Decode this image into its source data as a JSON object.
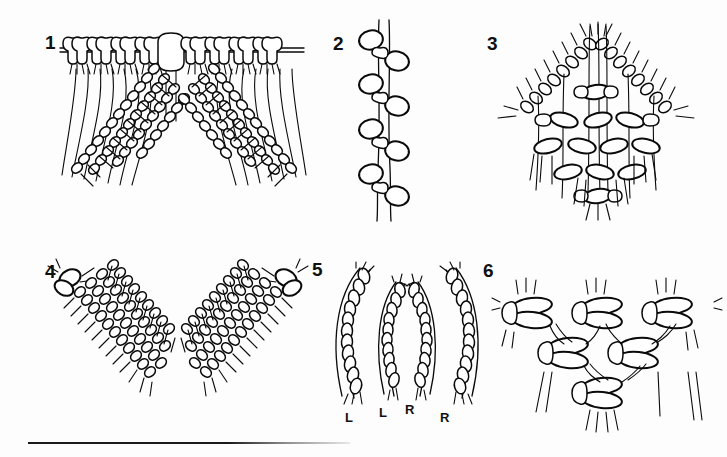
{
  "page": {
    "kind": "instructional-diagram-plate",
    "background_color": "#fdfdfd",
    "ink_color": "#0a0a0a",
    "figure_count": 6,
    "divider": {
      "name": "bottom-rule",
      "color": "#1a1a1a"
    }
  },
  "figures": [
    {
      "number": "1",
      "name": "figure-1-double-half-hitch-v-shape",
      "caption": "",
      "elements": {
        "holding_cord": "horizontal",
        "knot_count_top": 10,
        "center_bar": "vertical filler cord",
        "diagonal_rows": 4,
        "direction": "inverted V, both sides"
      }
    },
    {
      "number": "2",
      "name": "figure-2-vertical-chain-of-loops",
      "caption": "",
      "elements": {
        "orientation": "vertical",
        "loop_pairs": 6,
        "cords": 2
      }
    },
    {
      "number": "3",
      "name": "figure-3-diamond-lattice-panel",
      "caption": "",
      "elements": {
        "outline": "diamond",
        "lattice_rows": 4,
        "fringe": "all four edges"
      }
    },
    {
      "number": "4",
      "name": "figure-4-two-diagonal-knot-bands",
      "caption": "",
      "elements": {
        "bands": 2,
        "shape": "inverted V",
        "rows_per_band": 4,
        "corner_knots": 2
      }
    },
    {
      "number": "5",
      "name": "figure-5-four-curved-cords",
      "caption": "",
      "cords": [
        {
          "label": "L",
          "curve": "left"
        },
        {
          "label": "L",
          "curve": "left"
        },
        {
          "label": "R",
          "curve": "right"
        },
        {
          "label": "R",
          "curve": "right"
        }
      ]
    },
    {
      "number": "6",
      "name": "figure-6-open-net-v-panel",
      "caption": "",
      "elements": {
        "knot_clusters": 6,
        "rows": 3,
        "shape": "inverted V net",
        "fringe": "bottom and top"
      }
    }
  ]
}
